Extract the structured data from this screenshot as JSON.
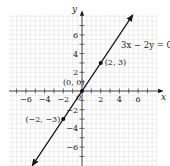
{
  "chart_data": {
    "type": "line",
    "title": "",
    "xlabel": "x",
    "ylabel": "y",
    "xlim": [
      -7.8,
      8.5
    ],
    "ylim": [
      -8.1,
      8.5
    ],
    "grid": true,
    "x_ticks": [
      -7,
      -6,
      -5,
      -4,
      -3,
      -2,
      -1,
      1,
      2,
      3,
      4,
      5,
      6,
      7
    ],
    "y_ticks": [
      -7,
      -6,
      -5,
      -4,
      -3,
      -2,
      -1,
      1,
      2,
      3,
      4,
      5,
      6,
      7
    ],
    "x_tick_labels": [
      "-6",
      "-4",
      "-2",
      "2",
      "4",
      "6"
    ],
    "x_tick_label_values": [
      -6,
      -4,
      -2,
      2,
      4,
      6
    ],
    "y_tick_labels": [
      "6",
      "4",
      "2",
      "-2",
      "-4",
      "-6"
    ],
    "y_tick_label_values": [
      6,
      4,
      2,
      -2,
      -4,
      -6
    ],
    "origin_label": "0",
    "series": [
      {
        "name": "3x − 2y = 0",
        "equation": "3x - 2y = 0",
        "slope": 1.5,
        "intercept": 0,
        "x_range": [
          -5.3,
          5.4
        ],
        "arrows": "both"
      }
    ],
    "points": [
      {
        "x": 0,
        "y": 0,
        "label": "(0, 0)"
      },
      {
        "x": 2,
        "y": 3,
        "label": "(2, 3)"
      },
      {
        "x": -2,
        "y": -3,
        "label": "(−2, −3)"
      }
    ],
    "annotations": [
      {
        "text": "3x − 2y = 0",
        "x": 3.3,
        "y": 6.5
      }
    ],
    "colors": {
      "line": "#1a1a1a",
      "axis": "#333333",
      "grid": "#e2e2e2",
      "point": "#111111"
    }
  }
}
